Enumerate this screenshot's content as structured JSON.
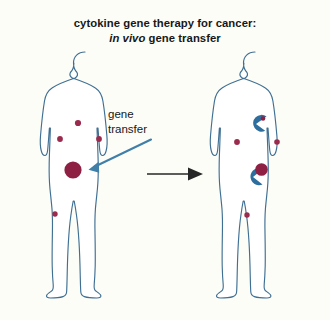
{
  "canvas": {
    "width": 330,
    "height": 320,
    "background": "#fdfdf8"
  },
  "title": {
    "line1": "cytokine gene therapy for cancer:",
    "line2_italic": "in vivo",
    "line2_rest": " gene transfer"
  },
  "annotation": {
    "label_line1": "gene",
    "label_line2": "transfer"
  },
  "colors": {
    "body_outline": "#3f6f93",
    "tumor_red": "#8e2044",
    "small_dot_red": "#9a2b4c",
    "immune_blue": "#2e6e9e",
    "arrow_blue": "#3f7fa8",
    "process_arrow_black": "#262626",
    "background": "#fdfdf8"
  },
  "figures": [
    {
      "name": "untreated-patient",
      "position": "left",
      "center_x": 85,
      "markers": [
        {
          "type": "small-tumor-dot",
          "x": 78,
          "y": 123,
          "r": 3.1
        },
        {
          "type": "small-tumor-dot",
          "x": 60,
          "y": 139,
          "r": 2.9
        },
        {
          "type": "small-tumor-dot",
          "x": 99,
          "y": 139,
          "r": 2.9
        },
        {
          "type": "large-tumor",
          "x": 73,
          "y": 170,
          "r": 8.6
        },
        {
          "type": "small-tumor-dot",
          "x": 55,
          "y": 214,
          "r": 2.7
        }
      ]
    },
    {
      "name": "treated-patient",
      "position": "right",
      "center_x": 255,
      "markers": [
        {
          "type": "immune-cell-engulfing-small",
          "x": 256,
          "y": 124,
          "r": 8.2,
          "dot_x": 262,
          "dot_y": 119,
          "dot_r": 2.2
        },
        {
          "type": "small-tumor-dot",
          "x": 237,
          "y": 142,
          "r": 2.9
        },
        {
          "type": "small-tumor-dot",
          "x": 277,
          "y": 142,
          "r": 2.8
        },
        {
          "type": "immune-cell-engulfing-large",
          "x": 254,
          "y": 176,
          "r": 8.4,
          "tumor_x": 262,
          "tumor_y": 169,
          "tumor_r": 6.2
        },
        {
          "type": "small-tumor-dot",
          "x": 247,
          "y": 215,
          "r": 2.7
        }
      ]
    }
  ],
  "arrows": [
    {
      "name": "gene-transfer-pointer",
      "color": "#3f7fa8",
      "from": {
        "x": 152,
        "y": 139
      },
      "to": {
        "x": 88,
        "y": 170
      }
    },
    {
      "name": "process-arrow",
      "color": "#262626",
      "from": {
        "x": 148,
        "y": 174
      },
      "to": {
        "x": 203,
        "y": 174
      }
    }
  ]
}
